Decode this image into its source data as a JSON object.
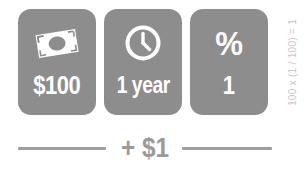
{
  "infographic": {
    "title": "Simple interest illustration",
    "accent_color": "#8d8d8d",
    "rule_color": "#9e9e9e",
    "card_text_color": "#ffffff",
    "formula_color": "#c9c9c9"
  },
  "cards": [
    {
      "icon": "banknote-icon",
      "label": "$100",
      "meaning": "principal amount"
    },
    {
      "icon": "clock-icon",
      "label": "1 year",
      "meaning": "time period"
    },
    {
      "icon": "percent-icon",
      "icon_glyph": "%",
      "label": "1",
      "meaning": "interest rate percent"
    }
  ],
  "formula": {
    "vertical_text": "100 x (1 / 100) = 1"
  },
  "result": {
    "text": "+ $1"
  }
}
